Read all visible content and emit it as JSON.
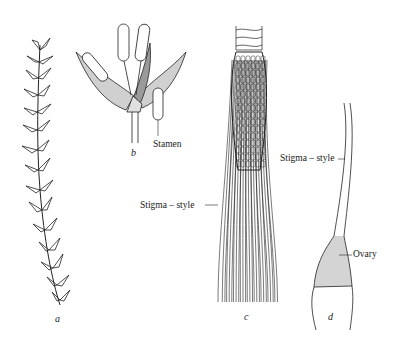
{
  "figure": {
    "panels": [
      {
        "letter": "a",
        "description": "leafy stem of plant"
      },
      {
        "letter": "b",
        "description": "floret with stamens",
        "labels": [
          "Stamen"
        ]
      },
      {
        "letter": "c",
        "description": "ear of corn with silks",
        "labels": [
          "Stigma – style"
        ]
      },
      {
        "letter": "d",
        "description": "single pistil",
        "labels": [
          "Stigma – style",
          "Ovary"
        ]
      }
    ],
    "labels": {
      "stamen": "Stamen",
      "stigma_style_c": "Stigma – style",
      "stigma_style_d": "Stigma – style",
      "ovary": "Ovary"
    },
    "letters": {
      "a": "a",
      "b": "b",
      "c": "c",
      "d": "d"
    },
    "colors": {
      "ink": "#222222",
      "stipple": "#bdbdbd",
      "background": "#ffffff"
    }
  }
}
